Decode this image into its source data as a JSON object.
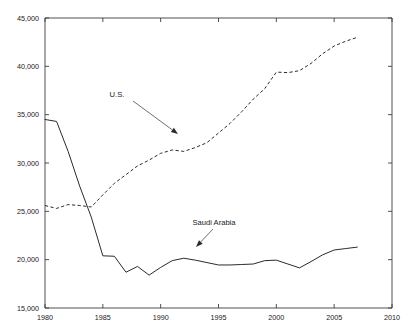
{
  "chart_data": {
    "type": "line",
    "title": "",
    "xlabel": "",
    "ylabel": "",
    "xlim": [
      1980,
      2010
    ],
    "ylim": [
      15000,
      45000
    ],
    "grid": false,
    "legend_position": "inline-annotations",
    "xticks": [
      "1980",
      "1985",
      "1990",
      "1995",
      "2000",
      "2005",
      "2010"
    ],
    "xtick_values": [
      1980,
      1985,
      1990,
      1995,
      2000,
      2005,
      2010
    ],
    "yticks": [
      "15,000",
      "20,000",
      "25,000",
      "30,000",
      "35,000",
      "40,000",
      "45,000"
    ],
    "ytick_values": [
      15000,
      20000,
      25000,
      30000,
      35000,
      40000,
      45000
    ],
    "x": [
      1980,
      1981,
      1982,
      1983,
      1984,
      1985,
      1986,
      1987,
      1988,
      1989,
      1990,
      1991,
      1992,
      1993,
      1994,
      1995,
      1996,
      1997,
      1998,
      1999,
      2000,
      2001,
      2002,
      2003,
      2004,
      2005,
      2006,
      2007
    ],
    "series": [
      {
        "name": "Saudi Arabia",
        "style": "solid",
        "color": "#2b2b2b",
        "values": [
          34500,
          34300,
          31200,
          27600,
          24400,
          20400,
          20350,
          18700,
          19300,
          18400,
          19200,
          19900,
          20150,
          19950,
          19700,
          19450,
          19450,
          19500,
          19550,
          19900,
          19950,
          19550,
          19150,
          19800,
          20500,
          21000,
          21150,
          21300
        ]
      },
      {
        "name": "U.S.",
        "style": "dashed",
        "color": "#2b2b2b",
        "values": [
          25600,
          25300,
          25700,
          25600,
          25450,
          26700,
          27900,
          28800,
          29700,
          30300,
          31000,
          31350,
          31200,
          31600,
          32100,
          33100,
          34100,
          35300,
          36600,
          37700,
          39400,
          39350,
          39550,
          40300,
          41300,
          42100,
          42600,
          43000
        ]
      }
    ],
    "annotations": [
      {
        "text": "U.S.",
        "label_x": 117,
        "label_y": 97,
        "leader_from": [
          133,
          101
        ],
        "leader_to": [
          178,
          134
        ],
        "target_series": "U.S."
      },
      {
        "text": "Saudi Arabia",
        "label_x": 214,
        "label_y": 225,
        "leader_from": [
          213,
          229
        ],
        "leader_to": [
          196,
          247
        ],
        "target_series": "Saudi Arabia"
      }
    ]
  },
  "plot_geometry": {
    "left": 45,
    "right": 392,
    "top": 18,
    "bottom": 308
  },
  "axis_labels": {
    "y": [
      "45,000",
      "40,000",
      "35,000",
      "30,000",
      "25,000",
      "20,000",
      "15,000"
    ],
    "x": [
      "1980",
      "1985",
      "1990",
      "1995",
      "2000",
      "2005",
      "2010"
    ]
  }
}
